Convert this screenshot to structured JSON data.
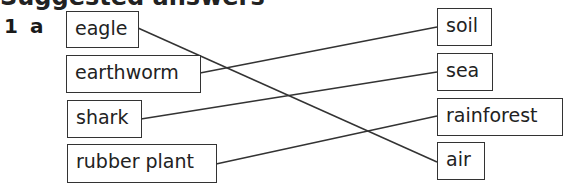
{
  "heading": {
    "visible_text": "Suggested answers",
    "cut_off": true
  },
  "question": {
    "number": "1",
    "part": "a"
  },
  "left_items": [
    {
      "label": "eagle"
    },
    {
      "label": "earthworm"
    },
    {
      "label": "shark"
    },
    {
      "label": "rubber plant"
    }
  ],
  "right_items": [
    {
      "label": "soil"
    },
    {
      "label": "sea"
    },
    {
      "label": "rainforest"
    },
    {
      "label": "air"
    }
  ],
  "matches": [
    {
      "from": "eagle",
      "to": "air"
    },
    {
      "from": "earthworm",
      "to": "soil"
    },
    {
      "from": "shark",
      "to": "sea"
    },
    {
      "from": "rubber plant",
      "to": "rainforest"
    }
  ]
}
